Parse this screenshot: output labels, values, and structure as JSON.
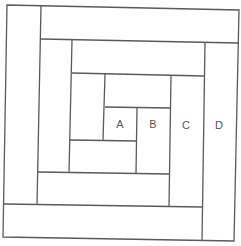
{
  "diagram": {
    "type": "log-cabin-quilt-block",
    "line_color": "#5a5a5a",
    "background": "#ffffff",
    "labels": [
      {
        "id": "A",
        "text": "A",
        "x": 120,
        "y": 125
      },
      {
        "id": "B",
        "text": "B",
        "x": 153,
        "y": 125
      },
      {
        "id": "C",
        "text": "C",
        "x": 186,
        "y": 126
      },
      {
        "id": "D",
        "text": "D",
        "x": 219,
        "y": 126
      }
    ]
  }
}
